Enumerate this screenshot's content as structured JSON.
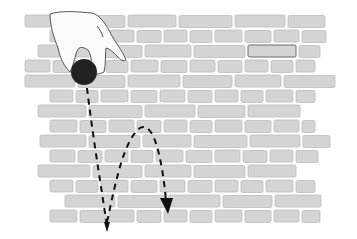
{
  "illustration": {
    "subject": "hand dropping a ball in front of a brick wall",
    "elements": {
      "wall": "brick-wall",
      "hand": "hand-icon",
      "ball": "ball",
      "trajectory_drop": "dashed straight fall path",
      "trajectory_bounce": "dashed bouncing arc path with arrowhead"
    },
    "colors": {
      "background": "#ffffff",
      "brick_fill": "#d4d4d4",
      "brick_stroke": "#bdbdbd",
      "mortar": "#ffffff",
      "ball": "#222222",
      "hand_fill": "#fafafa",
      "hand_stroke": "#555555",
      "trajectory": "#111111"
    }
  }
}
